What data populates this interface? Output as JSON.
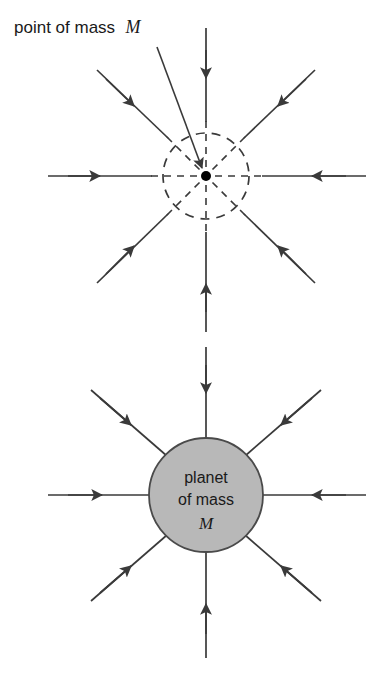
{
  "figure": {
    "background_color": "#ffffff",
    "line_color": "#3a3a3a",
    "planet_fill": "#b8b8b8",
    "planet_stroke": "#4a4a4a",
    "dot_color": "#000000"
  },
  "top_diagram": {
    "name": "point-mass-field",
    "label_line_1": "point of mass",
    "label_italic": "M",
    "center": {
      "x": 206,
      "y": 176
    },
    "dashed_circle_radius": 43,
    "point_dot_radius": 5,
    "field_line_count": 8,
    "field_direction": "inward",
    "leader_line": {
      "x1": 157,
      "y1": 47,
      "x2": 203,
      "y2": 170
    }
  },
  "bottom_diagram": {
    "name": "planet-field",
    "label_line_1": "planet",
    "label_line_2": "of mass",
    "label_italic": "M",
    "center": {
      "x": 206,
      "y": 495
    },
    "planet_radius": 57,
    "field_line_count": 8,
    "field_direction": "inward"
  },
  "field_lines": {
    "top": [
      {
        "name": "field-line-north",
        "angle": 270
      },
      {
        "name": "field-line-northeast",
        "angle": 315
      },
      {
        "name": "field-line-east",
        "angle": 0
      },
      {
        "name": "field-line-southeast",
        "angle": 45
      },
      {
        "name": "field-line-south",
        "angle": 90
      },
      {
        "name": "field-line-southwest",
        "angle": 135
      },
      {
        "name": "field-line-west",
        "angle": 180
      },
      {
        "name": "field-line-northwest",
        "angle": 225
      }
    ]
  }
}
